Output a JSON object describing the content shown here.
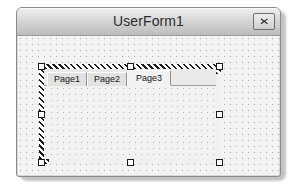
{
  "window": {
    "title": "UserForm1",
    "close_button": {
      "icon": "close-x-icon",
      "glyph": "✕",
      "tooltip": "Close"
    }
  },
  "designer": {
    "grid": "dot-grid",
    "selected_control": "MultiPage1",
    "handles": [
      "top-left",
      "top-middle",
      "top-right",
      "middle-left",
      "middle-right",
      "bottom-left",
      "bottom-middle",
      "bottom-right"
    ]
  },
  "multipage": {
    "selected_index": 2,
    "tabs": [
      {
        "label": "Page1",
        "selected": false
      },
      {
        "label": "Page2",
        "selected": false
      },
      {
        "label": "Page3",
        "selected": true
      }
    ]
  },
  "colors": {
    "window_face": "#d8d8d8",
    "titlebar_top": "#efefef",
    "titlebar_bottom": "#bcbcbc",
    "form_client": "#f3f3f3",
    "page_face": "#f2f2f2",
    "tab_face": "#e2e2e2",
    "grid_dot": "#a9a9a9",
    "border": "#8a8a8a",
    "text": "#2b2b2b"
  }
}
